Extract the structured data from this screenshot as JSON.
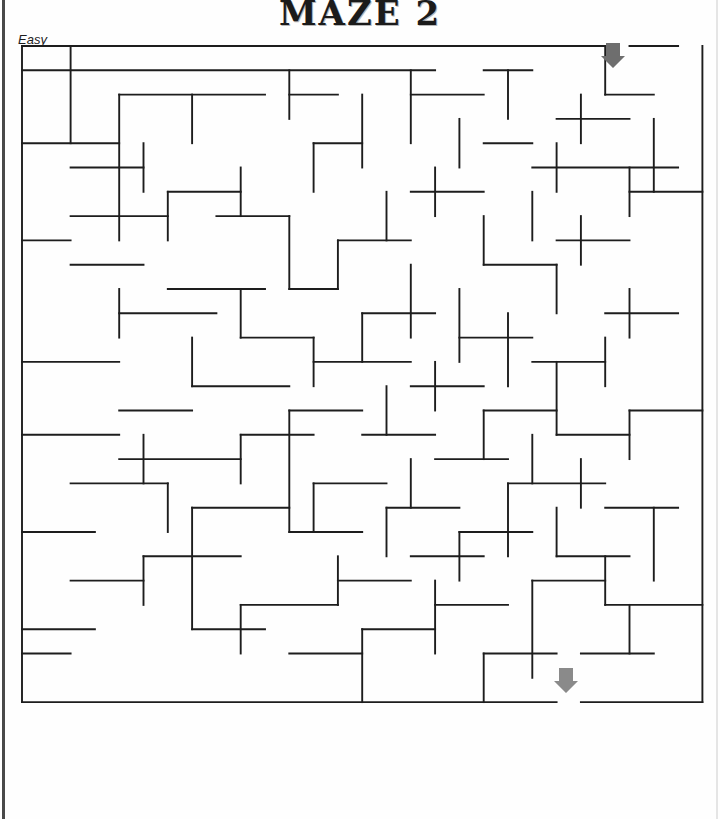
{
  "page": {
    "title": "MAZE 2",
    "difficulty_label": "Easy",
    "background_color": "#fefefe",
    "ink_color": "#1d1d1d"
  },
  "maze": {
    "type": "grid-maze",
    "cols": 28,
    "rows": 27,
    "cell_size": 24.3,
    "origin_x": 22,
    "origin_y": 46,
    "wall_color": "#1d1d1d",
    "wall_thickness": 1.9,
    "entrance": {
      "label": "entrance",
      "side": "top",
      "col": 24,
      "arrow_direction": "down",
      "arrow_color": "#6e6e6e",
      "arrow_x": 613,
      "arrow_y": 43
    },
    "exit": {
      "label": "exit",
      "side": "bottom",
      "col": 22,
      "arrow_direction": "down",
      "arrow_color": "#8a8a8a",
      "arrow_x": 566,
      "arrow_y": 668
    },
    "h_walls": [
      [
        0,
        0,
        24
      ],
      [
        25,
        0,
        27
      ],
      [
        0,
        1,
        17
      ],
      [
        19,
        1,
        21
      ],
      [
        4,
        2,
        10
      ],
      [
        11,
        2,
        13
      ],
      [
        16,
        2,
        19
      ],
      [
        24,
        2,
        26
      ],
      [
        22,
        3,
        25
      ],
      [
        0,
        4,
        4
      ],
      [
        12,
        4,
        14
      ],
      [
        19,
        4,
        21
      ],
      [
        2,
        5,
        5
      ],
      [
        21,
        5,
        27
      ],
      [
        6,
        6,
        9
      ],
      [
        16,
        6,
        19
      ],
      [
        25,
        6,
        28
      ],
      [
        2,
        7,
        6
      ],
      [
        8,
        7,
        11
      ],
      [
        0,
        8,
        2
      ],
      [
        13,
        8,
        16
      ],
      [
        22,
        8,
        25
      ],
      [
        2,
        9,
        5
      ],
      [
        19,
        9,
        22
      ],
      [
        6,
        10,
        10
      ],
      [
        11,
        10,
        13
      ],
      [
        4,
        11,
        8
      ],
      [
        14,
        11,
        17
      ],
      [
        24,
        11,
        27
      ],
      [
        9,
        12,
        12
      ],
      [
        18,
        12,
        21
      ],
      [
        0,
        13,
        4
      ],
      [
        12,
        13,
        16
      ],
      [
        21,
        13,
        24
      ],
      [
        7,
        14,
        11
      ],
      [
        16,
        14,
        19
      ],
      [
        4,
        15,
        7
      ],
      [
        11,
        15,
        14
      ],
      [
        19,
        15,
        22
      ],
      [
        25,
        15,
        28
      ],
      [
        0,
        16,
        4
      ],
      [
        9,
        16,
        12
      ],
      [
        14,
        16,
        17
      ],
      [
        22,
        16,
        25
      ],
      [
        4,
        17,
        9
      ],
      [
        17,
        17,
        20
      ],
      [
        2,
        18,
        6
      ],
      [
        12,
        18,
        15
      ],
      [
        20,
        18,
        24
      ],
      [
        7,
        19,
        11
      ],
      [
        15,
        19,
        18
      ],
      [
        24,
        19,
        27
      ],
      [
        0,
        20,
        3
      ],
      [
        11,
        20,
        14
      ],
      [
        18,
        20,
        21
      ],
      [
        5,
        21,
        9
      ],
      [
        16,
        21,
        19
      ],
      [
        22,
        21,
        25
      ],
      [
        2,
        22,
        5
      ],
      [
        13,
        22,
        16
      ],
      [
        21,
        22,
        24
      ],
      [
        9,
        23,
        13
      ],
      [
        17,
        23,
        20
      ],
      [
        24,
        23,
        28
      ],
      [
        0,
        24,
        3
      ],
      [
        7,
        24,
        10
      ],
      [
        14,
        24,
        17
      ],
      [
        0,
        25,
        2
      ],
      [
        11,
        25,
        14
      ],
      [
        19,
        25,
        22
      ],
      [
        23,
        25,
        26
      ],
      [
        0,
        27,
        22
      ],
      [
        23,
        27,
        28
      ]
    ],
    "v_walls": [
      [
        0,
        0,
        27
      ],
      [
        2,
        0,
        4
      ],
      [
        4,
        2,
        8
      ],
      [
        4,
        10,
        12
      ],
      [
        5,
        4,
        6
      ],
      [
        5,
        16,
        18
      ],
      [
        5,
        21,
        23
      ],
      [
        6,
        6,
        8
      ],
      [
        6,
        18,
        20
      ],
      [
        7,
        2,
        4
      ],
      [
        7,
        12,
        14
      ],
      [
        7,
        19,
        24
      ],
      [
        9,
        5,
        7
      ],
      [
        9,
        10,
        12
      ],
      [
        9,
        16,
        18
      ],
      [
        9,
        23,
        25
      ],
      [
        11,
        1,
        3
      ],
      [
        11,
        7,
        10
      ],
      [
        11,
        15,
        20
      ],
      [
        12,
        4,
        6
      ],
      [
        12,
        12,
        14
      ],
      [
        12,
        18,
        20
      ],
      [
        13,
        8,
        10
      ],
      [
        13,
        21,
        23
      ],
      [
        14,
        2,
        5
      ],
      [
        14,
        11,
        13
      ],
      [
        14,
        24,
        27
      ],
      [
        15,
        6,
        8
      ],
      [
        15,
        14,
        16
      ],
      [
        15,
        19,
        21
      ],
      [
        16,
        1,
        4
      ],
      [
        16,
        9,
        12
      ],
      [
        16,
        17,
        19
      ],
      [
        17,
        5,
        7
      ],
      [
        17,
        13,
        15
      ],
      [
        17,
        22,
        25
      ],
      [
        18,
        3,
        5
      ],
      [
        18,
        10,
        13
      ],
      [
        18,
        20,
        22
      ],
      [
        19,
        7,
        9
      ],
      [
        19,
        15,
        17
      ],
      [
        19,
        25,
        27
      ],
      [
        20,
        1,
        3
      ],
      [
        20,
        11,
        14
      ],
      [
        20,
        18,
        21
      ],
      [
        21,
        6,
        8
      ],
      [
        21,
        16,
        18
      ],
      [
        21,
        22,
        26
      ],
      [
        22,
        4,
        6
      ],
      [
        22,
        9,
        11
      ],
      [
        22,
        13,
        16
      ],
      [
        22,
        19,
        21
      ],
      [
        23,
        2,
        4
      ],
      [
        23,
        7,
        9
      ],
      [
        23,
        17,
        19
      ],
      [
        24,
        0,
        2
      ],
      [
        24,
        12,
        14
      ],
      [
        24,
        21,
        23
      ],
      [
        25,
        5,
        7
      ],
      [
        25,
        10,
        12
      ],
      [
        25,
        15,
        17
      ],
      [
        25,
        23,
        25
      ],
      [
        26,
        3,
        6
      ],
      [
        26,
        19,
        22
      ],
      [
        28,
        0,
        27
      ]
    ]
  }
}
